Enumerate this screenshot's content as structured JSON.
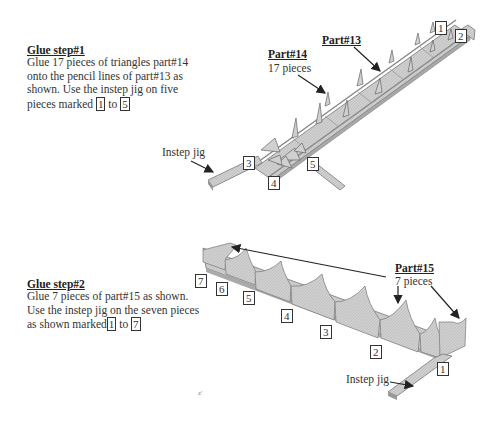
{
  "step1": {
    "title": "Glue step#1",
    "lines": [
      "Glue 17 pieces of triangles part#14",
      "onto the pencil lines of part#13 as",
      "shown. Use the instep jig on five"
    ],
    "last_line_prefix": "pieces marked",
    "marker_start": "1",
    "last_line_mid": "to",
    "marker_end": "5",
    "part14_label": "Part#14",
    "part14_count": "17 pieces",
    "part13_label": "Part#13",
    "jig_label": "Instep jig",
    "markers": [
      "1",
      "2",
      "3",
      "4",
      "5"
    ]
  },
  "step2": {
    "title": "Glue step#2",
    "lines": [
      "Glue 7 pieces  of  part#15  as  shown.",
      "Use the instep jig on the seven pieces"
    ],
    "last_line_prefix": "as shown marked",
    "marker_start": "1",
    "last_line_mid": "to",
    "marker_end": "7",
    "part15_label": "Part#15",
    "part15_count": "7 pieces",
    "jig_label": "Instep jig",
    "markers": [
      "1",
      "2",
      "3",
      "4",
      "5",
      "6",
      "7"
    ]
  },
  "colors": {
    "part_fill": "#c8c8c8",
    "part_edge": "#6a6a6a",
    "arrow": "#222222"
  }
}
